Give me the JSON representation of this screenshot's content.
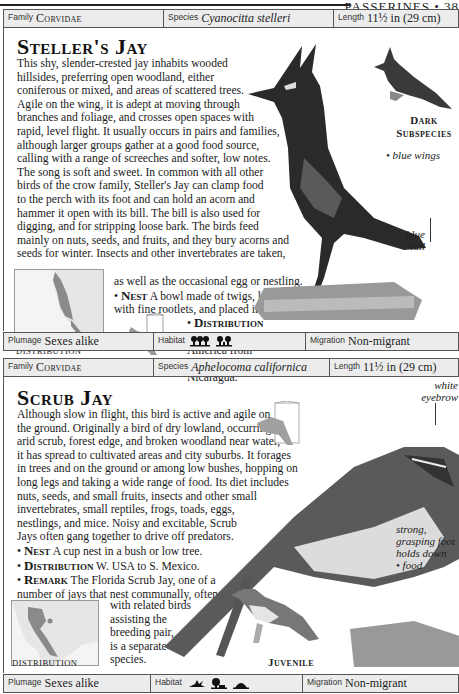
{
  "running_head": "PASSERINES • 38",
  "entries": [
    {
      "header": {
        "family_label": "Family",
        "family_value": "Corvidae",
        "species_label": "Species",
        "species_value": "Cyanocitta stelleri",
        "length_label": "Length",
        "length_value": "11½ in (29 cm)"
      },
      "title": "Steller's Jay",
      "body_lines": [
        "This shy, slender-crested jay inhabits wooded",
        "hillsides, preferring open woodland, either",
        "coniferous or mixed, and areas of scattered trees.",
        "Agile on the wing, it is adept at moving through",
        "branches and foliage, and crosses open spaces with",
        "rapid, level flight. It usually occurs in pairs and families,",
        "although larger groups gather at a good food source,",
        "calling with a range of screeches and softer, low notes.",
        "The song is soft and sweet. In common with all other",
        "birds of the crow family, Steller's Jay can clamp food",
        "to the perch with its foot and can hold an acorn and",
        "hammer it open with its bill. The bill is also used for",
        "digging, and for stripping loose bark. The birds feed",
        "mainly on nuts, seeds, and fruits, and they bury acorns and",
        "seeds for winter. Insects and other invertebrates are taken,"
      ],
      "narrow_lines": [
        "as well as the occasional egg or nestling.",
        "with fine rootlets, and placed in a tree."
      ],
      "nest_label": "Nest",
      "nest_text": "A bowl made of twigs, lined",
      "distribution_label": "Distribution",
      "distribution_lines": [
        "W. North",
        "America from",
        "Alaska to",
        "Nicaragua."
      ],
      "map_caption": "DISTRIBUTION",
      "inset_caption": [
        "Dark",
        "Subspecies"
      ],
      "annotations": {
        "blue_wings": "blue wings",
        "blue_tail": [
          "blue",
          "tail"
        ]
      },
      "footer": {
        "plumage_label": "Plumage",
        "plumage_value": "Sexes alike",
        "habitat_label": "Habitat",
        "habitat_icons": [
          "forest-icon",
          "woodland-icon"
        ],
        "migration_label": "Migration",
        "migration_value": "Non-migrant"
      }
    },
    {
      "header": {
        "family_label": "Family",
        "family_value": "Corvidae",
        "species_label": "Species",
        "species_value": "Aphelocoma californica",
        "length_label": "Length",
        "length_value": "11½ in (29 cm)"
      },
      "title": "Scrub Jay",
      "body_lines": [
        "Although slow in flight, this bird is active and agile on",
        "the ground. Originally a bird of dry lowland, occurring in",
        "arid scrub, forest edge, and broken woodland near water,",
        "it has spread to cultivated areas and city suburbs. It forages",
        "in trees and on the ground or among low bushes, hopping on",
        "long legs and taking a wide range of food. Its diet includes",
        "nuts, seeds, and small fruits, insects and other small",
        "invertebrates, small reptiles, frogs, toads, eggs,",
        "nestlings, and mice. Noisy and excitable, Scrub",
        "Jays often gang together to drive off predators."
      ],
      "nest_label": "Nest",
      "nest_text": "A cup nest in a bush or low tree.",
      "distribution_label": "Distribution",
      "distribution_text": "W. USA to S. Mexico.",
      "remark_label": "Remark",
      "remark_lines": [
        "The Florida Scrub Jay, one of a",
        "number of jays that nest communally, often"
      ],
      "remark_narrow_lines": [
        "with related birds",
        "assisting the",
        "breeding pair,",
        "is a separate",
        "species."
      ],
      "map_caption": "DISTRIBUTION",
      "inset_caption": "Juvenile",
      "annotations": {
        "white_eyebrow": [
          "white",
          "eyebrow"
        ],
        "strong_foot": [
          "strong,",
          "grasping foot",
          "holds down",
          "food"
        ]
      },
      "footer": {
        "plumage_label": "Plumage",
        "plumage_value": "Sexes alike",
        "habitat_label": "Habitat",
        "habitat_icons": [
          "scrub-icon",
          "woodland-edge-icon",
          "urban-icon"
        ],
        "migration_label": "Migration",
        "migration_value": "Non-migrant"
      }
    }
  ]
}
